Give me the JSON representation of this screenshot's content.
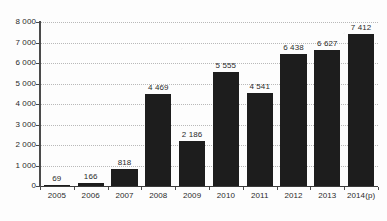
{
  "chart_data": {
    "type": "bar",
    "title": "",
    "subtitle": "",
    "xlabel": "",
    "ylabel": "",
    "categories": [
      "2005",
      "2006",
      "2007",
      "2008",
      "2009",
      "2010",
      "2011",
      "2012",
      "2013",
      "2014(p)"
    ],
    "values": [
      69,
      166,
      818,
      4469,
      2186,
      5555,
      4541,
      6438,
      6627,
      7412
    ],
    "value_labels": [
      "69",
      "166",
      "818",
      "4 469",
      "2 186",
      "5 555",
      "4 541",
      "6 438",
      "6 627",
      "7 412"
    ],
    "ylim": [
      0,
      8000
    ],
    "ytick_values": [
      0,
      1000,
      2000,
      3000,
      4000,
      5000,
      6000,
      7000,
      8000
    ],
    "ytick_labels": [
      "0",
      "1 000",
      "2 000",
      "3 000",
      "4 000",
      "5 000",
      "6 000",
      "7 000",
      "8 000"
    ],
    "grid": true,
    "legend": false,
    "legend_position": "none",
    "bar_color": "#1d1d1d",
    "gridline_color": "#b9b9b9",
    "axis_color": "#4a4a4a",
    "label_color": "#2b2b2b",
    "background_color": "#fdfdfd"
  }
}
